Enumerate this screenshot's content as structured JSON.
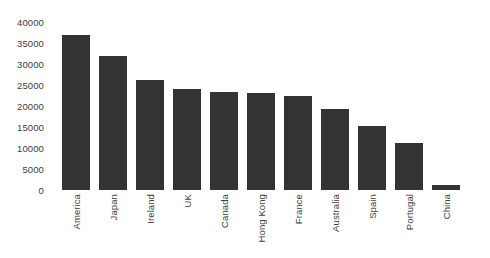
{
  "chart_data": {
    "type": "bar",
    "title": "",
    "subtitle": "",
    "xlabel": "",
    "ylabel": "",
    "categories": [
      "America",
      "Japan",
      "Ireland",
      "UK",
      "Canada",
      "Hong Kong",
      "France",
      "Australia",
      "Spain",
      "Portugal",
      "China"
    ],
    "values": [
      36800,
      32000,
      26300,
      24000,
      23300,
      23200,
      22300,
      19400,
      15200,
      11200,
      1300
    ],
    "series": [
      {
        "name": "Value",
        "values": [
          36800,
          32000,
          26300,
          24000,
          23300,
          23200,
          22300,
          19400,
          15200,
          11200,
          1300
        ]
      }
    ],
    "ylim": [
      0,
      40000
    ],
    "yticks": [
      0,
      5000,
      10000,
      15000,
      20000,
      25000,
      30000,
      35000,
      40000
    ],
    "ytick_labels": [
      "0",
      "5000",
      "10000",
      "15000",
      "20000",
      "25000",
      "30000",
      "35000",
      "40000"
    ],
    "grid": false,
    "legend": false,
    "legend_position": "none",
    "xtick_rotation": 90,
    "bar_color": "#333333",
    "background_color": "#ffffff",
    "axis_text_color": "#3d3d3d"
  }
}
